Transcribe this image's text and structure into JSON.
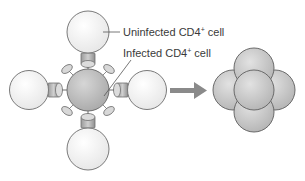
{
  "labels": {
    "uninfected": {
      "text": "Uninfected CD4",
      "sup": "+",
      "suffix": " cell"
    },
    "infected": {
      "text": "Infected CD4",
      "sup": "+",
      "suffix": " cell"
    }
  },
  "colors": {
    "uninfected_fill": "#f6f6f6",
    "infected_fill": "#c8c8c8",
    "syncytium_fill": "#d4d4d4",
    "outline": "#7a7a7a",
    "receptor_fill": "#b5b5b5",
    "arrow": "#8a8a8a",
    "leader_line": "#555555"
  },
  "diagram": {
    "stage_left": "Infected CD4+ cell binding four uninfected CD4+ cells",
    "stage_right": "Syncytium formed by fused cells",
    "arrow": "right-arrow"
  }
}
